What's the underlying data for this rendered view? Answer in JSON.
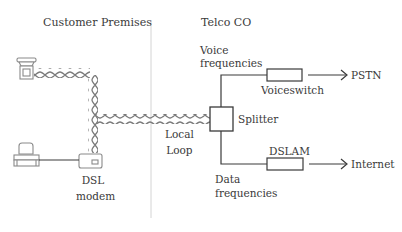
{
  "sections": {
    "customer": "Customer Premises",
    "telco": "Telco CO"
  },
  "labels": {
    "dsl_modem_line1": "DSL",
    "dsl_modem_line2": "modem",
    "local_loop_line1": "Local",
    "local_loop_line2": "Loop",
    "splitter": "Splitter",
    "voice_freq_line1": "Voice",
    "voice_freq_line2": "frequencies",
    "voiceswitch": "Voiceswitch",
    "pstn": "PSTN",
    "dslam": "DSLAM",
    "internet": "Internet",
    "data_freq_line1": "Data",
    "data_freq_line2": "frequencies"
  },
  "icons": {
    "phone": "telephone-icon",
    "computer": "computer-icon",
    "modem": "dsl-modem-icon"
  },
  "colors": {
    "line": "#3a3a3a",
    "twisted_pair": "#7a7a7a",
    "divider": "#d4d4d4",
    "icon": "#8a8a8a"
  }
}
